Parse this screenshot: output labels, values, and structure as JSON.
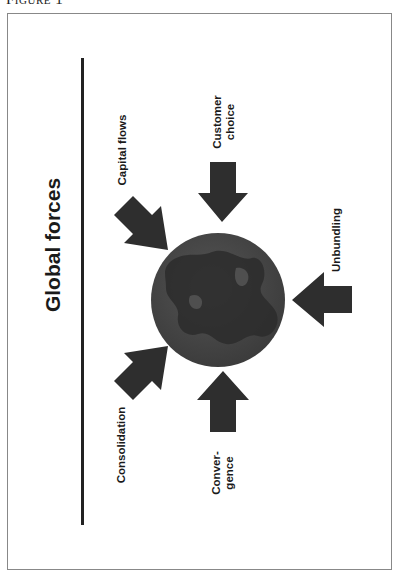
{
  "figure": {
    "caption": "Figure 1",
    "title": "Global forces",
    "orientation": "rotated -90deg",
    "center_element": "globe",
    "colors": {
      "arrow": "#2e2e2e",
      "globe_ocean": "#4a4a4a",
      "globe_land": "#2b2b2b",
      "frame": "#888888",
      "divider": "#222222"
    },
    "forces": [
      {
        "label": "Capital flows",
        "line1": "Capital flows",
        "line2": "",
        "arrow_direction": "toward globe (down-right)"
      },
      {
        "label": "Customer choice",
        "line1": "Customer",
        "line2": "choice",
        "arrow_direction": "toward globe (down)"
      },
      {
        "label": "Unbundling",
        "line1": "Unbundling",
        "line2": "",
        "arrow_direction": "toward globe (left)"
      },
      {
        "label": "Convergence",
        "line1": "Conver-",
        "line2": "gence",
        "arrow_direction": "toward globe (up)"
      },
      {
        "label": "Consolidation",
        "line1": "Consolidation",
        "line2": "",
        "arrow_direction": "toward globe (up-right)"
      }
    ]
  }
}
